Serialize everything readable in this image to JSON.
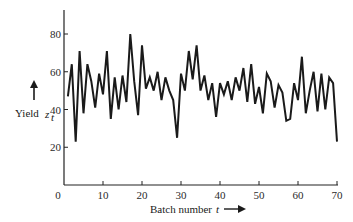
{
  "chart_data": {
    "type": "line",
    "title": "",
    "xlabel": "Batch number t",
    "ylabel": "Yield z_t",
    "xlim": [
      0,
      70
    ],
    "ylim": [
      0,
      92
    ],
    "xticks": [
      0,
      10,
      20,
      30,
      40,
      50,
      60,
      70
    ],
    "yticks": [
      20,
      40,
      60,
      80
    ],
    "grid": false,
    "legend": null,
    "x": [
      1,
      2,
      3,
      4,
      5,
      6,
      7,
      8,
      9,
      10,
      11,
      12,
      13,
      14,
      15,
      16,
      17,
      18,
      19,
      20,
      21,
      22,
      23,
      24,
      25,
      26,
      27,
      28,
      29,
      30,
      31,
      32,
      33,
      34,
      35,
      36,
      37,
      38,
      39,
      40,
      41,
      42,
      43,
      44,
      45,
      46,
      47,
      48,
      49,
      50,
      51,
      52,
      53,
      54,
      55,
      56,
      57,
      58,
      59,
      60,
      61,
      62,
      63,
      64,
      65,
      66,
      67,
      68,
      69,
      70
    ],
    "series": [
      {
        "name": "Yield",
        "values": [
          47,
          64,
          23,
          71,
          38,
          64,
          55,
          41,
          59,
          48,
          71,
          35,
          57,
          40,
          58,
          44,
          80,
          55,
          37,
          74,
          51,
          57,
          50,
          60,
          45,
          57,
          50,
          45,
          25,
          59,
          50,
          71,
          56,
          74,
          50,
          58,
          45,
          54,
          36,
          54,
          48,
          55,
          45,
          57,
          50,
          62,
          44,
          64,
          43,
          52,
          38,
          59,
          55,
          41,
          53,
          49,
          34,
          35,
          54,
          45,
          68,
          38,
          50,
          60,
          39,
          59,
          40,
          57,
          54,
          23
        ]
      }
    ]
  },
  "labels": {
    "y_axis_word": "Yield",
    "y_axis_symbol": "z",
    "y_axis_subscript": "t",
    "x_axis_text": "Batch number",
    "x_axis_symbol": "t"
  },
  "tick_text": {
    "x": [
      "0",
      "10",
      "20",
      "30",
      "40",
      "50",
      "60",
      "70"
    ],
    "y": [
      "20",
      "40",
      "60",
      "80"
    ]
  }
}
